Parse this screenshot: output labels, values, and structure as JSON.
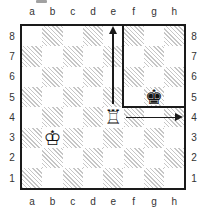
{
  "diagram": {
    "type": "chess-position",
    "files": [
      "a",
      "b",
      "c",
      "d",
      "e",
      "f",
      "g",
      "h"
    ],
    "ranks": [
      "8",
      "7",
      "6",
      "5",
      "4",
      "3",
      "2",
      "1"
    ],
    "pieces": [
      {
        "id": "white-king",
        "name": "king",
        "color": "white",
        "square": "b3",
        "glyph": "♔"
      },
      {
        "id": "white-rook",
        "name": "rook",
        "color": "white",
        "square": "e4",
        "glyph": "♖"
      },
      {
        "id": "black-king",
        "name": "king",
        "color": "black",
        "square": "g5",
        "glyph": "♚"
      }
    ],
    "annotations": {
      "arrows": [
        {
          "from": "e4",
          "to": "e8",
          "direction": "up",
          "style": "solid"
        },
        {
          "from": "e4",
          "to": "h4",
          "direction": "right",
          "style": "solid"
        }
      ],
      "box": {
        "area": "f5-h8",
        "description": "confinement box drawn around black king"
      }
    },
    "artifact": {
      "description": "cropped text fragment above diagram"
    },
    "colors": {
      "board_line": "#1a1a1a",
      "hatch": "#c6c6c6",
      "label": "#333333",
      "background": "#ffffff"
    }
  }
}
